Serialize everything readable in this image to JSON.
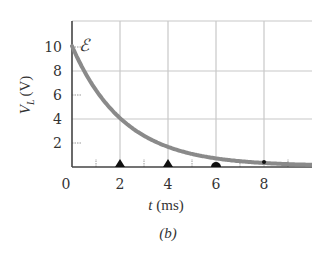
{
  "chart_data": {
    "type": "line",
    "title": "",
    "panel_label": "(b)",
    "xlabel": "t (ms)",
    "xlabel_var": "t",
    "xlabel_unit": "(ms)",
    "ylabel": "V_L (V)",
    "ylabel_var": "V",
    "ylabel_sub": "L",
    "ylabel_unit": "(V)",
    "xlim": [
      0,
      10
    ],
    "ylim": [
      0,
      12
    ],
    "x_ticks": [
      0,
      2,
      4,
      6,
      8
    ],
    "x_tick_labels": [
      "0",
      "2",
      "4",
      "6",
      "8"
    ],
    "y_ticks": [
      2,
      4,
      6,
      8,
      10
    ],
    "y_tick_labels": [
      "2",
      "4",
      "6",
      "8",
      "10"
    ],
    "grid": true,
    "annotation": "ℰ",
    "annotation_meaning": "emf value at t=0 (10 V)",
    "markers": [
      {
        "t": 2,
        "shape": "triangle"
      },
      {
        "t": 4,
        "shape": "triangle"
      },
      {
        "t": 6,
        "shape": "semicircle"
      },
      {
        "t": 8,
        "shape": "dot"
      }
    ],
    "series": [
      {
        "name": "V_L",
        "description": "exponential decay V = 10·e^(-t/τ), τ ≈ 2.2 ms",
        "x": [
          0,
          1,
          2,
          3,
          4,
          5,
          6,
          7,
          8,
          9,
          10
        ],
        "values": [
          10.0,
          6.3,
          4.0,
          2.5,
          1.6,
          1.0,
          0.64,
          0.41,
          0.26,
          0.17,
          0.1
        ]
      }
    ],
    "colors": {
      "curve": "#8a8a8a",
      "grid": "#c8c8c8",
      "axis": "#444444",
      "text": "#333333"
    }
  }
}
